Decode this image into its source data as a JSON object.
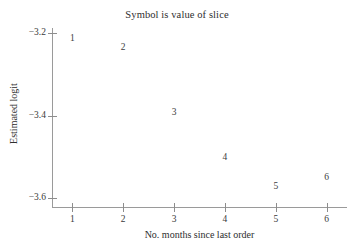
{
  "chart_data": {
    "type": "scatter",
    "title": "Symbol is value of slice",
    "xlabel": "No. months since last order",
    "ylabel": "Estimated logit",
    "x": [
      1,
      2,
      3,
      4,
      5,
      6
    ],
    "values": [
      -3.217,
      -3.239,
      -3.396,
      -3.505,
      -3.576,
      -3.554
    ],
    "point_labels": [
      "1",
      "2",
      "3",
      "4",
      "5",
      "6"
    ],
    "xlim": [
      0.6,
      6.4
    ],
    "ylim": [
      -3.62,
      -3.17
    ],
    "xticks": [
      1,
      2,
      3,
      4,
      5,
      6
    ],
    "xtick_labels": [
      "1",
      "2",
      "3",
      "4",
      "5",
      "6"
    ],
    "yticks": [
      -3.2,
      -3.4,
      -3.6
    ],
    "ytick_labels": [
      "−3.2",
      "−3.4",
      "−3.6"
    ],
    "grid": false,
    "legend": "none",
    "marker_style": "text-symbol",
    "series_name": "value of slice"
  },
  "colors": {
    "background": "#ffffff",
    "axis": "#9a9a9a",
    "tick": "#8d8d8d",
    "text": "#3a3a3a",
    "title": "#2e2e2e",
    "symbol": "#3d3d3d"
  }
}
